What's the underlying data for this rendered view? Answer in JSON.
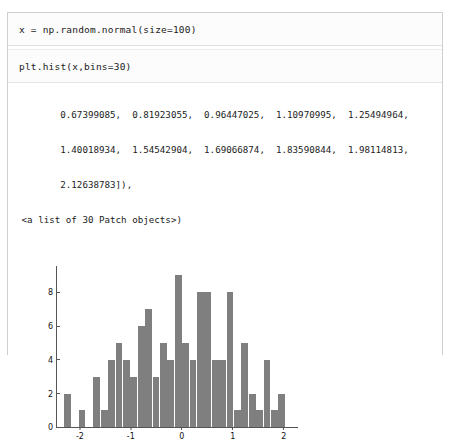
{
  "notebook": {
    "cells": [
      {
        "name": "input-cell-1",
        "code": "x = np.random.normal(size=100)"
      },
      {
        "name": "input-cell-2",
        "code": "plt.hist(x,bins=30)"
      }
    ],
    "output_lines": [
      "        0.67399085,  0.81923055,  0.96447025,  1.10970995,  1.25494964,",
      "        1.40018934,  1.54542904,  1.69066874,  1.83590844,  1.98114813,",
      "        2.12638783]),",
      " <a list of 30 Patch objects>)"
    ]
  },
  "chart_data": {
    "type": "bar",
    "title": "",
    "xlabel": "",
    "ylabel": "",
    "xlim": [
      -2.45,
      2.3
    ],
    "ylim": [
      0,
      9.6
    ],
    "xticks": [
      "-2",
      "-1",
      "0",
      "1",
      "2"
    ],
    "xtick_values": [
      -2,
      -1,
      0,
      1,
      2
    ],
    "yticks": [
      "0",
      "2",
      "4",
      "6",
      "8"
    ],
    "ytick_values": [
      0,
      2,
      4,
      6,
      8
    ],
    "grid": false,
    "legend": null,
    "bar_color": "#7f7f7f",
    "bins": 30,
    "bin_edges": [
      -2.316,
      -2.171,
      -2.026,
      -1.881,
      -1.735,
      -1.59,
      -1.445,
      -1.3,
      -1.154,
      -1.009,
      -0.864,
      -0.719,
      -0.573,
      -0.428,
      -0.283,
      -0.138,
      0.008,
      0.153,
      0.298,
      0.443,
      0.589,
      0.734,
      0.879,
      1.024,
      1.17,
      1.315,
      1.46,
      1.605,
      1.751,
      1.896,
      2.041
    ],
    "values": [
      2,
      0,
      1,
      0,
      3,
      1,
      4,
      5,
      4,
      3,
      6,
      7,
      3,
      5,
      4,
      9,
      5,
      4,
      8,
      8,
      4,
      4,
      8,
      1,
      5,
      2,
      1,
      4,
      1,
      2
    ]
  }
}
